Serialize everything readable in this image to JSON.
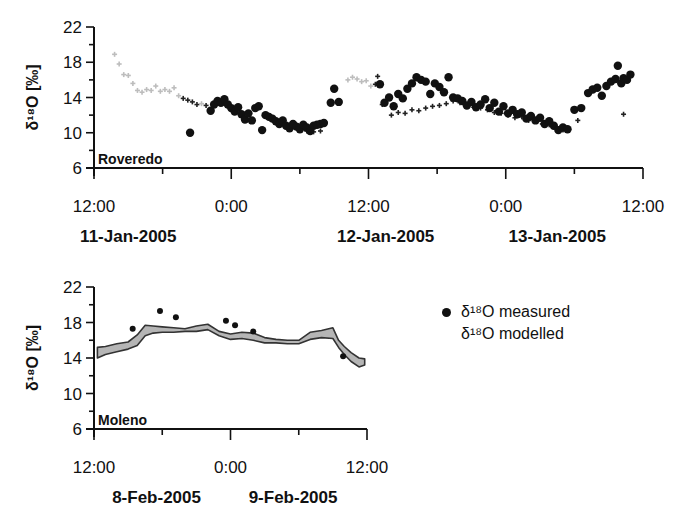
{
  "legend": {
    "measured": "δ¹⁸O measured",
    "modelled": "δ¹⁸O modelled"
  },
  "colors": {
    "measured": "#111111",
    "modelled_light": "#bdbdbd",
    "modelled_band_fill": "#b5b5b5",
    "modelled_band_edge": "#333333",
    "axis": "#111111"
  },
  "chart_data": [
    {
      "type": "scatter",
      "panel": "top",
      "site_label": "Roveredo",
      "title": "",
      "ylabel": "δ¹⁸O [‰]",
      "xlabel": "",
      "ylim": [
        6,
        22
      ],
      "yticks": [
        6,
        10,
        14,
        18,
        22
      ],
      "yminor_step": 2,
      "xlim_hours": [
        0,
        48
      ],
      "xticks": [
        {
          "h": 0,
          "label": "12:00"
        },
        {
          "h": 12,
          "label": "0:00"
        },
        {
          "h": 24,
          "label": "12:00"
        },
        {
          "h": 36,
          "label": "0:00"
        },
        {
          "h": 48,
          "label": "12:00"
        }
      ],
      "xminor_step_hours": 6,
      "date_labels": [
        {
          "h": 3,
          "label": "11-Jan-2005"
        },
        {
          "h": 25.5,
          "label": "12-Jan-2005"
        },
        {
          "h": 40.5,
          "label": "13-Jan-2005"
        }
      ],
      "grid": false,
      "legend_position": "right of lower panel",
      "series": [
        {
          "name": "δ¹⁸O measured",
          "marker": "filled-circle",
          "points": [
            [
              8.4,
              10.0
            ],
            [
              10.2,
              12.5
            ],
            [
              10.5,
              13.2
            ],
            [
              10.8,
              13.6
            ],
            [
              11.1,
              13.4
            ],
            [
              11.4,
              13.8
            ],
            [
              11.7,
              13.2
            ],
            [
              12.0,
              12.8
            ],
            [
              12.3,
              12.4
            ],
            [
              12.6,
              12.9
            ],
            [
              12.9,
              12.1
            ],
            [
              13.2,
              11.5
            ],
            [
              13.5,
              12.2
            ],
            [
              13.8,
              11.4
            ],
            [
              14.1,
              12.8
            ],
            [
              14.4,
              13.0
            ],
            [
              14.7,
              10.3
            ],
            [
              15.0,
              12.0
            ],
            [
              15.3,
              11.8
            ],
            [
              15.6,
              11.6
            ],
            [
              15.9,
              11.3
            ],
            [
              16.2,
              11.0
            ],
            [
              16.5,
              11.4
            ],
            [
              16.8,
              10.8
            ],
            [
              17.1,
              10.5
            ],
            [
              17.4,
              11.0
            ],
            [
              17.7,
              10.7
            ],
            [
              18.0,
              10.4
            ],
            [
              18.3,
              10.9
            ],
            [
              18.6,
              10.6
            ],
            [
              18.9,
              10.2
            ],
            [
              19.2,
              10.8
            ],
            [
              19.5,
              10.9
            ],
            [
              19.8,
              11.0
            ],
            [
              20.1,
              11.1
            ],
            [
              20.7,
              13.4
            ],
            [
              21.0,
              15.0
            ],
            [
              21.4,
              13.5
            ],
            [
              25.0,
              15.5
            ],
            [
              25.4,
              13.4
            ],
            [
              25.8,
              14.0
            ],
            [
              26.2,
              13.0
            ],
            [
              26.6,
              14.4
            ],
            [
              27.0,
              13.9
            ],
            [
              27.4,
              15.0
            ],
            [
              27.8,
              15.6
            ],
            [
              28.2,
              16.3
            ],
            [
              28.6,
              16.0
            ],
            [
              29.0,
              15.8
            ],
            [
              29.4,
              14.4
            ],
            [
              29.8,
              15.6
            ],
            [
              30.2,
              15.2
            ],
            [
              30.6,
              14.6
            ],
            [
              31.0,
              16.3
            ],
            [
              31.4,
              14.0
            ],
            [
              31.8,
              13.9
            ],
            [
              32.2,
              13.6
            ],
            [
              32.6,
              13.1
            ],
            [
              33.0,
              13.5
            ],
            [
              33.4,
              12.9
            ],
            [
              33.8,
              13.2
            ],
            [
              34.2,
              13.8
            ],
            [
              34.6,
              12.8
            ],
            [
              35.0,
              13.4
            ],
            [
              35.4,
              12.4
            ],
            [
              35.8,
              13.0
            ],
            [
              36.2,
              12.2
            ],
            [
              36.6,
              12.6
            ],
            [
              37.0,
              12.1
            ],
            [
              37.4,
              12.3
            ],
            [
              37.8,
              11.6
            ],
            [
              38.2,
              11.9
            ],
            [
              38.6,
              11.4
            ],
            [
              39.0,
              11.7
            ],
            [
              39.4,
              11.0
            ],
            [
              39.8,
              11.3
            ],
            [
              40.2,
              10.8
            ],
            [
              40.6,
              10.3
            ],
            [
              41.0,
              10.6
            ],
            [
              41.4,
              10.4
            ],
            [
              42.0,
              12.6
            ],
            [
              42.6,
              12.8
            ],
            [
              43.2,
              14.5
            ],
            [
              43.6,
              14.9
            ],
            [
              44.0,
              15.1
            ],
            [
              44.4,
              14.2
            ],
            [
              44.8,
              15.3
            ],
            [
              45.2,
              15.8
            ],
            [
              45.6,
              16.1
            ],
            [
              45.8,
              17.6
            ],
            [
              46.1,
              15.6
            ],
            [
              46.3,
              16.2
            ],
            [
              46.6,
              16.0
            ],
            [
              46.9,
              16.6
            ]
          ]
        },
        {
          "name": "δ¹⁸O modelled",
          "marker": "small-plus",
          "note": "light grey where no measurements, dark where overlapping measurements",
          "points": [
            [
              1.8,
              18.9
            ],
            [
              2.2,
              17.8
            ],
            [
              2.6,
              16.6
            ],
            [
              3.0,
              16.5
            ],
            [
              3.4,
              15.6
            ],
            [
              3.8,
              14.8
            ],
            [
              4.2,
              14.6
            ],
            [
              4.6,
              14.9
            ],
            [
              5.0,
              14.8
            ],
            [
              5.4,
              15.3
            ],
            [
              5.8,
              14.7
            ],
            [
              6.2,
              14.9
            ],
            [
              6.6,
              14.7
            ],
            [
              7.0,
              15.1
            ],
            [
              7.4,
              14.2
            ],
            [
              7.8,
              13.9
            ],
            [
              8.2,
              13.7
            ],
            [
              8.6,
              13.5
            ],
            [
              9.0,
              13.2
            ],
            [
              9.4,
              13.3
            ],
            [
              9.8,
              13.1
            ],
            [
              18.6,
              10.2
            ],
            [
              19.2,
              10.1
            ],
            [
              19.8,
              10.2
            ],
            [
              22.2,
              16.0
            ],
            [
              22.6,
              16.3
            ],
            [
              23.0,
              16.1
            ],
            [
              23.4,
              15.8
            ],
            [
              23.8,
              15.9
            ],
            [
              24.2,
              15.3
            ],
            [
              24.6,
              15.5
            ],
            [
              24.8,
              16.4
            ],
            [
              25.2,
              13.2
            ],
            [
              26.0,
              12.0
            ],
            [
              26.6,
              12.3
            ],
            [
              27.2,
              12.2
            ],
            [
              27.8,
              12.6
            ],
            [
              28.4,
              12.5
            ],
            [
              29.0,
              12.8
            ],
            [
              29.6,
              13.0
            ],
            [
              30.2,
              13.1
            ],
            [
              30.8,
              13.3
            ],
            [
              31.4,
              13.6
            ],
            [
              32.0,
              13.4
            ],
            [
              32.6,
              13.2
            ],
            [
              33.2,
              12.9
            ],
            [
              33.8,
              12.8
            ],
            [
              34.4,
              12.6
            ],
            [
              35.0,
              12.3
            ],
            [
              35.6,
              12.2
            ],
            [
              36.2,
              12.0
            ],
            [
              36.8,
              11.7
            ],
            [
              37.4,
              11.8
            ],
            [
              38.0,
              11.4
            ],
            [
              38.6,
              11.3
            ],
            [
              39.2,
              11.0
            ],
            [
              39.8,
              10.9
            ],
            [
              40.4,
              10.6
            ],
            [
              41.0,
              10.3
            ],
            [
              42.3,
              11.4
            ],
            [
              46.3,
              12.1
            ]
          ]
        }
      ]
    },
    {
      "type": "scatter",
      "panel": "bottom",
      "site_label": "Moleno",
      "title": "",
      "ylabel": "δ¹⁸O [‰]",
      "xlabel": "",
      "ylim": [
        6,
        22
      ],
      "yticks": [
        6,
        10,
        14,
        18,
        22
      ],
      "yminor_step": 2,
      "xlim_hours": [
        0,
        24
      ],
      "xticks": [
        {
          "h": 0,
          "label": "12:00"
        },
        {
          "h": 12,
          "label": "0:00"
        },
        {
          "h": 24,
          "label": "12:00"
        }
      ],
      "xminor_step_hours": 6,
      "date_labels": [
        {
          "h": 5.5,
          "label": "8-Feb-2005"
        },
        {
          "h": 17.5,
          "label": "9-Feb-2005"
        }
      ],
      "grid": false,
      "series": [
        {
          "name": "δ¹⁸O measured",
          "marker": "small-filled-circle",
          "points": [
            [
              3.4,
              17.3
            ],
            [
              5.8,
              19.3
            ],
            [
              7.2,
              18.6
            ],
            [
              11.6,
              18.2
            ],
            [
              12.4,
              17.7
            ],
            [
              14.0,
              17.0
            ],
            [
              21.9,
              14.2
            ]
          ]
        },
        {
          "name": "δ¹⁸O modelled",
          "marker": "band",
          "upper": [
            [
              0.3,
              15.2
            ],
            [
              1.0,
              15.3
            ],
            [
              2.0,
              15.6
            ],
            [
              3.0,
              15.8
            ],
            [
              3.8,
              16.6
            ],
            [
              4.5,
              17.7
            ],
            [
              5.2,
              17.6
            ],
            [
              6.0,
              17.5
            ],
            [
              7.0,
              17.4
            ],
            [
              8.0,
              17.3
            ],
            [
              9.0,
              17.6
            ],
            [
              10.0,
              17.8
            ],
            [
              11.0,
              17.0
            ],
            [
              12.0,
              16.7
            ],
            [
              13.0,
              16.9
            ],
            [
              14.0,
              16.8
            ],
            [
              15.0,
              16.3
            ],
            [
              16.0,
              16.1
            ],
            [
              17.0,
              16.0
            ],
            [
              18.0,
              16.0
            ],
            [
              19.0,
              16.9
            ],
            [
              20.0,
              17.1
            ],
            [
              21.0,
              17.4
            ],
            [
              21.5,
              16.0
            ],
            [
              22.0,
              15.3
            ],
            [
              22.6,
              14.6
            ],
            [
              23.3,
              14.0
            ],
            [
              23.8,
              13.9
            ]
          ],
          "lower": [
            [
              0.3,
              14.0
            ],
            [
              1.0,
              14.4
            ],
            [
              2.0,
              14.7
            ],
            [
              3.0,
              15.0
            ],
            [
              3.8,
              15.4
            ],
            [
              4.5,
              16.5
            ],
            [
              5.2,
              16.8
            ],
            [
              6.0,
              16.9
            ],
            [
              7.0,
              16.9
            ],
            [
              8.0,
              17.0
            ],
            [
              9.0,
              17.0
            ],
            [
              10.0,
              17.2
            ],
            [
              11.0,
              16.5
            ],
            [
              12.0,
              16.1
            ],
            [
              13.0,
              16.2
            ],
            [
              14.0,
              16.0
            ],
            [
              15.0,
              15.7
            ],
            [
              16.0,
              15.7
            ],
            [
              17.0,
              15.6
            ],
            [
              18.0,
              15.6
            ],
            [
              19.0,
              16.1
            ],
            [
              20.0,
              16.3
            ],
            [
              21.0,
              16.2
            ],
            [
              21.5,
              15.2
            ],
            [
              22.0,
              14.4
            ],
            [
              22.6,
              13.6
            ],
            [
              23.3,
              13.0
            ],
            [
              23.8,
              13.2
            ]
          ]
        }
      ]
    }
  ]
}
